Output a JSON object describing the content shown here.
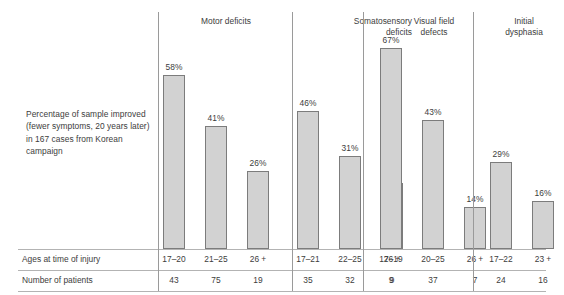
{
  "caption": "Percentage of sample improved (fewer symptoms, 20 years later) in 167 cases from Korean campaign",
  "table": {
    "row_labels": [
      "Ages at time of injury",
      "Number of patients"
    ]
  },
  "chart_data": {
    "type": "bar",
    "title": "",
    "xlabel": "",
    "ylabel": "Percentage of sample improved",
    "ylim": [
      0,
      70
    ],
    "grid": false,
    "legend": "none",
    "value_suffix": "%",
    "groups": [
      {
        "name": "Motor deficits",
        "categories": [
          "17–20",
          "21–25",
          "26 +"
        ],
        "values": [
          58,
          41,
          26
        ],
        "value_labels": [
          "58%",
          "41%",
          "26%"
        ],
        "patients": [
          43,
          75,
          19
        ]
      },
      {
        "name": "Somatosensory deficits",
        "categories": [
          "17–21",
          "22–25",
          "26 +"
        ],
        "values": [
          46,
          31,
          22
        ],
        "value_labels": [
          "46%",
          "31%",
          "22%"
        ],
        "patients": [
          35,
          32,
          9
        ]
      },
      {
        "name": "Visual field defects",
        "categories": [
          "17–19",
          "20–25",
          "26 +"
        ],
        "values": [
          67,
          43,
          14
        ],
        "value_labels": [
          "67%",
          "43%",
          "14%"
        ],
        "patients": [
          9,
          37,
          7
        ]
      },
      {
        "name": "Initial dysphasia",
        "categories": [
          "17–22",
          "23 +"
        ],
        "values": [
          29,
          16
        ],
        "value_labels": [
          "29%",
          "16%"
        ],
        "patients": [
          24,
          16
        ]
      }
    ]
  },
  "colors": {
    "bar_fill": "#d2d2d2",
    "bar_stroke": "#7c7c7c",
    "rule": "#b3b3b3",
    "divider": "#9a9a9a",
    "text": "#3d3d3d",
    "background": "#ffffff"
  }
}
